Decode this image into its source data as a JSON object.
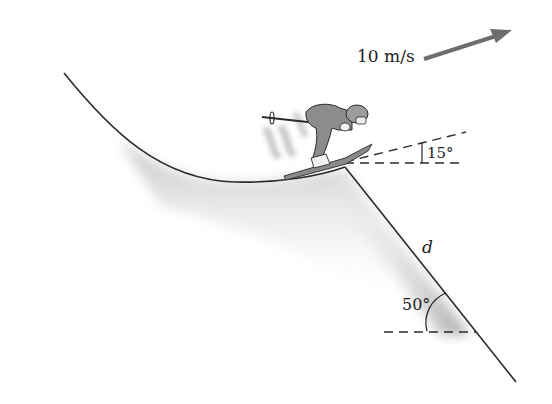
{
  "diagram": {
    "velocity_label": "10 m/s",
    "takeoff_angle_label": "15°",
    "slope_angle_label": "50°",
    "distance_label": "d",
    "colors": {
      "line": "#2a2a2a",
      "arrow": "#6e6e6e",
      "shade": "#9a9a9a"
    }
  }
}
